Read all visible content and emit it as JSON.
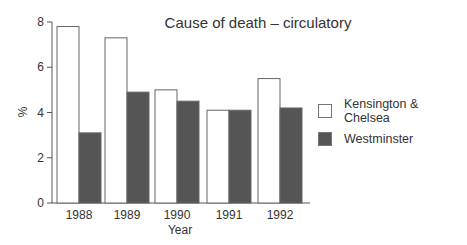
{
  "chart_data": {
    "type": "bar",
    "title": "Cause of death – circulatory",
    "xlabel": "Year",
    "ylabel": "%",
    "categories": [
      "1988",
      "1989",
      "1990",
      "1991",
      "1992"
    ],
    "series": [
      {
        "name": "Kensington & Chelsea",
        "color": "#ffffff",
        "values": [
          7.8,
          7.3,
          5.0,
          4.1,
          5.5
        ]
      },
      {
        "name": "Westminster",
        "color": "#555555",
        "values": [
          3.1,
          4.9,
          4.5,
          4.1,
          4.2
        ]
      }
    ],
    "ylim": [
      0,
      8
    ],
    "yticks": [
      "0",
      "2",
      "4",
      "6",
      "8"
    ],
    "grid": false,
    "legend_position": "right"
  }
}
